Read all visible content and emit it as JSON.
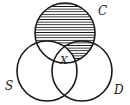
{
  "diagram": {
    "type": "venn",
    "sets": [
      {
        "id": "C",
        "label": "C",
        "cx": 65,
        "cy": 33,
        "r": 30
      },
      {
        "id": "S",
        "label": "S",
        "cx": 47,
        "cy": 71,
        "r": 30
      },
      {
        "id": "D",
        "label": "D",
        "cx": 82,
        "cy": 71,
        "r": 30
      }
    ],
    "shaded_region": "C minus S (C only and C∩D not S), horizontal hatching",
    "region_label": "X",
    "region_label_meaning": "C ∩ S ∩ D",
    "colors": {
      "stroke": "#1a1a1a",
      "background": "#ffffff"
    }
  },
  "labels": {
    "c": "C",
    "s": "S",
    "d": "D",
    "x": "X"
  }
}
